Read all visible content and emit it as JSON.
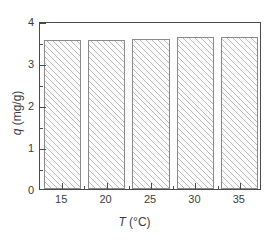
{
  "chart_data": {
    "type": "bar",
    "title": "",
    "xlabel": "T (°C)",
    "ylabel": "q (mg/g)",
    "xlabel_symbol": "T",
    "xlabel_unit": "(°C)",
    "ylabel_symbol": "q",
    "ylabel_unit": "(mg/g)",
    "categories": [
      15,
      20,
      25,
      30,
      35
    ],
    "values": [
      3.55,
      3.54,
      3.57,
      3.61,
      3.62
    ],
    "xlim": [
      12.5,
      37.5
    ],
    "ylim": [
      0,
      4
    ],
    "x_ticks": [
      15,
      20,
      25,
      30,
      35
    ],
    "x_tick_labels": [
      "15",
      "20",
      "25",
      "30",
      "35"
    ],
    "x_minor_ticks": [
      17.5,
      22.5,
      27.5,
      32.5
    ],
    "y_ticks": [
      0,
      1,
      2,
      3,
      4
    ],
    "y_tick_labels": [
      "0",
      "1",
      "2",
      "3",
      "4"
    ],
    "y_minor_ticks": [
      0.5,
      1.5,
      2.5,
      3.5
    ],
    "grid": false,
    "legend": false,
    "bar_fill": "hatched-diagonal",
    "bar_width": 4.2,
    "colors": {
      "axis": "#4a4a4a",
      "bar_edge": "#8a8a8a",
      "hatch": "#b9b9b9",
      "background": "#ffffff",
      "text": "#3d3d3d"
    }
  }
}
